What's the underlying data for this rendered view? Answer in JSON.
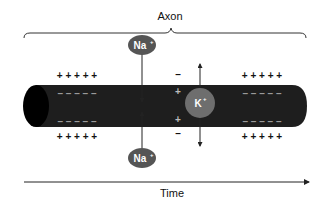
{
  "title": "Axon",
  "xaxis": {
    "label": "Time"
  },
  "ions": {
    "na_top": {
      "label": "Na",
      "charge": "+"
    },
    "na_bottom": {
      "label": "Na",
      "charge": "+"
    },
    "k": {
      "label": "K",
      "charge": "+"
    }
  },
  "charges": {
    "outside_resting": "+ + + + +",
    "inside_resting": "– – – – –",
    "local_top_outer": "–",
    "local_top_inner": "+",
    "local_bottom_inner": "+",
    "local_bottom_outer": "–"
  },
  "colors": {
    "axon_body": "#1e1e1e",
    "axon_end": "#000000",
    "ion_fill": "#555555",
    "k_fill": "#6e6e6e",
    "ion_text": "#ffffff",
    "dash_color": "#9a9a9a",
    "line": "#222222"
  }
}
